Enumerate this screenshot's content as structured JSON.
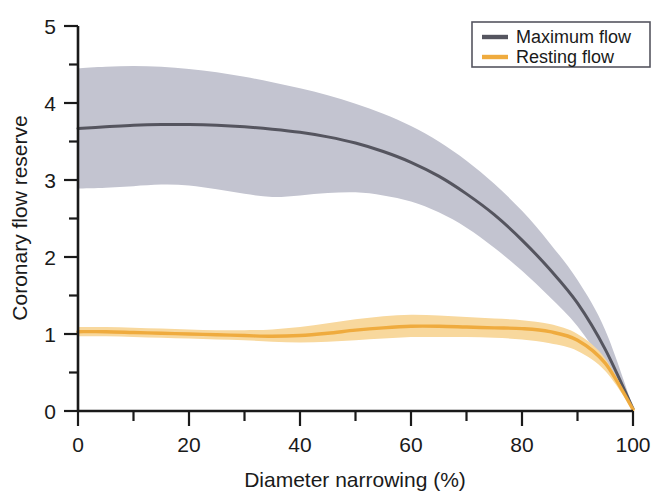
{
  "chart_data": {
    "type": "line",
    "title": "",
    "xlabel": "Diameter narrowing (%)",
    "ylabel": "Coronary flow reserve",
    "xlim": [
      0,
      100
    ],
    "ylim": [
      0,
      5
    ],
    "grid": false,
    "legend_position": "top-right",
    "xticks": [
      0,
      20,
      40,
      60,
      80,
      100
    ],
    "xtick_labels": [
      "0",
      "20",
      "40",
      "60",
      "80",
      "100"
    ],
    "xminor_ticks": [
      10,
      30,
      50,
      70,
      90
    ],
    "yticks": [
      0,
      1,
      2,
      3,
      4,
      5
    ],
    "ytick_labels": [
      "0",
      "1",
      "2",
      "3",
      "4",
      "5"
    ],
    "yminor_ticks": [
      0.5,
      1.5,
      2.5,
      3.5,
      4.5
    ],
    "x": [
      0,
      5,
      10,
      15,
      20,
      25,
      30,
      35,
      40,
      45,
      50,
      55,
      60,
      65,
      70,
      75,
      80,
      85,
      90,
      95,
      100
    ],
    "series": [
      {
        "name": "Maximum flow",
        "color": "#55555f",
        "band_color": "#c3c4d0",
        "values": [
          3.67,
          3.69,
          3.71,
          3.72,
          3.72,
          3.71,
          3.69,
          3.66,
          3.62,
          3.56,
          3.48,
          3.37,
          3.23,
          3.05,
          2.82,
          2.55,
          2.22,
          1.84,
          1.4,
          0.8,
          0.03
        ],
        "band_upper": [
          4.45,
          4.47,
          4.48,
          4.47,
          4.44,
          4.4,
          4.34,
          4.27,
          4.19,
          4.1,
          3.99,
          3.86,
          3.7,
          3.5,
          3.25,
          2.95,
          2.6,
          2.18,
          1.7,
          1.05,
          0.05
        ],
        "band_lower": [
          2.89,
          2.9,
          2.92,
          2.94,
          2.93,
          2.88,
          2.82,
          2.78,
          2.8,
          2.83,
          2.84,
          2.8,
          2.72,
          2.58,
          2.38,
          2.12,
          1.82,
          1.48,
          1.1,
          0.58,
          0.01
        ]
      },
      {
        "name": "Resting flow",
        "color": "#efab3e",
        "band_color": "#f8d89d",
        "values": [
          1.03,
          1.03,
          1.02,
          1.01,
          1.0,
          0.99,
          0.98,
          0.97,
          0.98,
          1.01,
          1.05,
          1.08,
          1.1,
          1.1,
          1.09,
          1.08,
          1.07,
          1.03,
          0.92,
          0.62,
          0.02
        ],
        "band_upper": [
          1.09,
          1.09,
          1.08,
          1.07,
          1.06,
          1.05,
          1.05,
          1.06,
          1.09,
          1.14,
          1.19,
          1.23,
          1.25,
          1.24,
          1.22,
          1.2,
          1.18,
          1.13,
          1.0,
          0.68,
          0.03
        ],
        "band_lower": [
          0.97,
          0.97,
          0.96,
          0.95,
          0.94,
          0.93,
          0.92,
          0.9,
          0.89,
          0.9,
          0.92,
          0.94,
          0.96,
          0.96,
          0.96,
          0.95,
          0.93,
          0.88,
          0.78,
          0.52,
          0.01
        ]
      }
    ]
  },
  "legend": {
    "items": [
      {
        "label": "Maximum flow",
        "swatch": "legend-swatch-maximum-flow"
      },
      {
        "label": "Resting flow",
        "swatch": "legend-swatch-resting-flow"
      }
    ]
  },
  "axes": {
    "x_title": "Diameter narrowing (%)",
    "y_title": "Coronary flow reserve",
    "x_labels": [
      "0",
      "20",
      "40",
      "60",
      "80",
      "100"
    ],
    "y_labels": [
      "0",
      "1",
      "2",
      "3",
      "4",
      "5"
    ]
  },
  "colors": {
    "maximum_flow_line": "#55555f",
    "maximum_flow_band": "#c3c4d0",
    "resting_flow_line": "#efab3e",
    "resting_flow_band": "#f8d89d",
    "axis": "#1a1a1a",
    "background": "#ffffff"
  }
}
